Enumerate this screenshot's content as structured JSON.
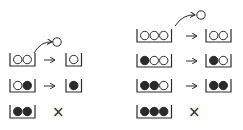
{
  "colors": {
    "ink": "#2a2a2a",
    "background": "#ffffff"
  },
  "symbols": {
    "reject": "×"
  },
  "panels": [
    {
      "name": "two-slot",
      "ejected": {
        "type": "open",
        "arrow_from": [
          34,
          53
        ],
        "arrow_to": [
          52,
          42
        ],
        "circle": [
          57,
          42
        ]
      },
      "rows": [
        {
          "y": 60,
          "before": [
            "open",
            "open"
          ],
          "after": [
            "open"
          ],
          "result": "arrow"
        },
        {
          "y": 86,
          "before": [
            "open",
            "filled"
          ],
          "after": [
            "filled"
          ],
          "result": "arrow"
        },
        {
          "y": 112,
          "before": [
            "filled",
            "filled"
          ],
          "after": [],
          "result": "reject"
        }
      ],
      "box_x": 10,
      "arrow_x": 44,
      "after_x": 66,
      "reject_x": 52
    },
    {
      "name": "three-slot",
      "ejected": {
        "type": "open",
        "arrow_from": [
          175,
          26
        ],
        "arrow_to": [
          195,
          15
        ],
        "circle": [
          201,
          15
        ]
      },
      "rows": [
        {
          "y": 36,
          "before": [
            "open",
            "open",
            "open"
          ],
          "after": [
            "open",
            "open"
          ],
          "result": "arrow"
        },
        {
          "y": 61,
          "before": [
            "filled",
            "open",
            "open"
          ],
          "after": [
            "filled",
            "open"
          ],
          "result": "arrow"
        },
        {
          "y": 86,
          "before": [
            "filled",
            "filled",
            "open"
          ],
          "after": [
            "filled",
            "filled"
          ],
          "result": "arrow"
        },
        {
          "y": 112,
          "before": [
            "filled",
            "filled",
            "filled"
          ],
          "after": [],
          "result": "reject"
        }
      ],
      "box_x": 137,
      "arrow_x": 186,
      "after_x": 206,
      "reject_x": 188
    }
  ]
}
